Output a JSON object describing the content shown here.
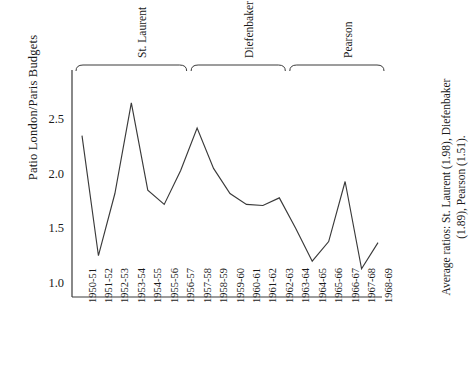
{
  "chart_data": {
    "type": "line",
    "title": "",
    "ylabel": "Patio London/Paris Budgets",
    "xlabel": "",
    "ylim": [
      1.0,
      2.75
    ],
    "yticks": [
      "1.0",
      "1.5",
      "2.0",
      "2.5"
    ],
    "ytick_values": [
      1.0,
      1.5,
      2.0,
      2.5
    ],
    "grid": false,
    "legend": "none",
    "categories": [
      "1950-51",
      "1951-52",
      "1952-53",
      "1953-54",
      "1954-55",
      "1955-56",
      "1956-57",
      "1957-58",
      "1958-59",
      "1959-60",
      "1960-61",
      "1961-62",
      "1962-63",
      "1963-64",
      "1964-65",
      "1965-66",
      "1966-67",
      "1967-68",
      "1968-69"
    ],
    "values": [
      2.35,
      1.25,
      1.82,
      2.65,
      1.85,
      1.72,
      2.03,
      2.42,
      2.05,
      1.82,
      1.72,
      1.71,
      1.78,
      1.5,
      1.2,
      1.38,
      1.93,
      1.13,
      1.37
    ],
    "annotations": [
      {
        "label": "St. Laurent",
        "span": [
          "1950-51",
          "1956-57"
        ]
      },
      {
        "label": "Diefenbaker",
        "span": [
          "1957-58",
          "1962-63"
        ]
      },
      {
        "label": "Pearson",
        "span": [
          "1963-64",
          "1968-69"
        ]
      }
    ],
    "note": "Average ratios: St. Laurent (1.98), Diefenbaker (1.89), Pearson (1.51).",
    "line_color": "#3a3a3a"
  }
}
